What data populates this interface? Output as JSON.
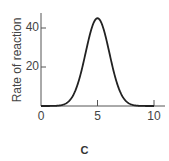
{
  "chart_data": {
    "type": "line",
    "title": "",
    "panel_label": "C",
    "xlabel": "",
    "ylabel": "Rate of reaction",
    "xlim": [
      0,
      10.8
    ],
    "ylim": [
      0,
      48
    ],
    "xticks": [
      0,
      5,
      10
    ],
    "yticks": [
      20,
      40
    ],
    "x_tick_labels": [
      "0",
      "5",
      "10"
    ],
    "y_tick_labels": [
      "20",
      "40"
    ],
    "grid": false,
    "legend": null,
    "series": [
      {
        "name": "Rate of reaction",
        "color": "#222222",
        "x": [
          0,
          1,
          2,
          2.5,
          3,
          3.5,
          4,
          4.5,
          5,
          5.5,
          6,
          6.5,
          7,
          7.5,
          8,
          9,
          10
        ],
        "y": [
          0,
          0,
          0.3,
          2,
          7,
          18,
          32,
          42,
          45,
          42,
          32,
          18,
          7,
          2,
          0.3,
          0,
          0
        ]
      }
    ]
  }
}
